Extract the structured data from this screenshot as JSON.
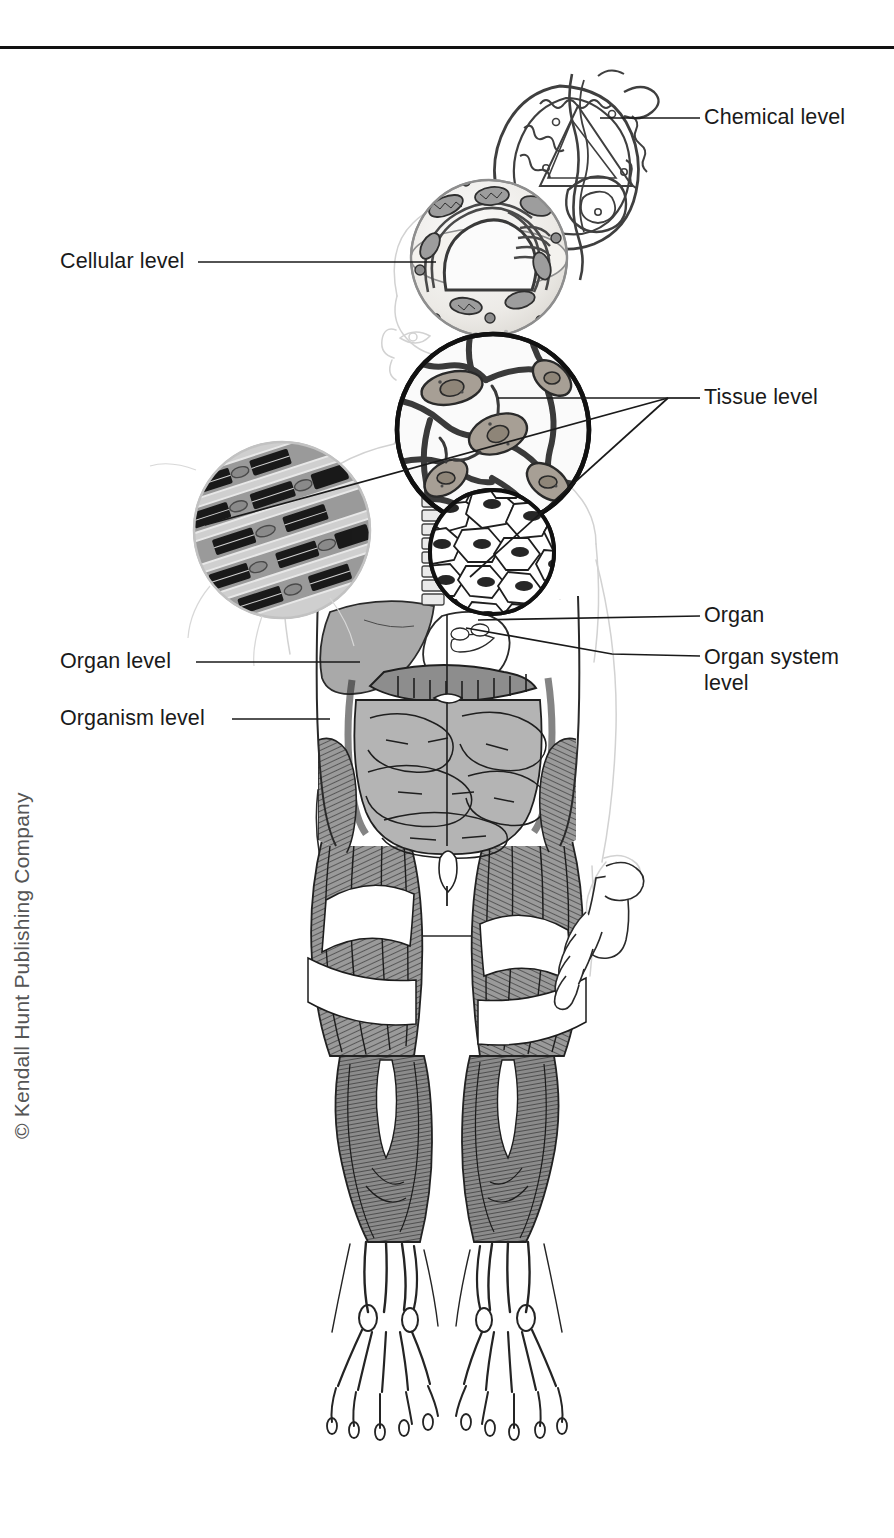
{
  "figure": {
    "top_rule": true,
    "copyright": "© Kendall Hunt Publishing Company",
    "labels": {
      "chemical": "Chemical level",
      "cellular": "Cellular level",
      "tissue": "Tissue level",
      "organ": "Organ",
      "organ_system": "Organ system\nlevel",
      "organ_level": "Organ level",
      "organism": "Organism level"
    },
    "colors": {
      "ink": "#1a1a1a",
      "rule": "#111111",
      "body_outline": "#cfcfcf",
      "organ_fill": "#a8a8a8",
      "muscle_fill": "#8f8f8f",
      "tissue_fill": "#b5b0a8",
      "light_fill": "#efefef",
      "copyright_text": "#555555"
    },
    "levels": [
      {
        "name": "Chemical level",
        "depicts": "protein-molecule",
        "callout_from": [
          641,
          118
        ],
        "callout_to": [
          703,
          118
        ]
      },
      {
        "name": "Cellular level",
        "depicts": "animal-cell-cutaway",
        "callout_from": [
          200,
          262
        ],
        "callout_to": [
          430,
          262
        ]
      },
      {
        "name": "Tissue level",
        "depicts": "nerve-tissue-circle, muscle-tissue-circle, epithelial-tissue-circle",
        "callout_hub": [
          672,
          398
        ],
        "callout_to": [
          703,
          398
        ]
      },
      {
        "name": "Organ",
        "depicts": "stomach",
        "callout_from": [
          478,
          622
        ],
        "callout_to": [
          703,
          618
        ]
      },
      {
        "name": "Organ system level",
        "depicts": "digestive-system",
        "callout_from": [
          470,
          630
        ],
        "callout_to": [
          703,
          660
        ]
      },
      {
        "name": "Organ level",
        "depicts": "liver",
        "callout_from": [
          352,
          662
        ],
        "callout_to": [
          190,
          662
        ]
      },
      {
        "name": "Organism level",
        "depicts": "whole-human-body",
        "callout_from": [
          330,
          719
        ],
        "callout_to": [
          200,
          719
        ]
      }
    ]
  }
}
